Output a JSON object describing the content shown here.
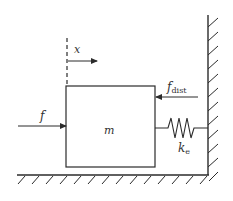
{
  "diagram": {
    "type": "mass-spring-wall",
    "stroke_color": "#2b2b2b",
    "labels": {
      "displacement": "x",
      "force": "f",
      "mass": "m",
      "disturbance_main": "f",
      "disturbance_sub": "dist",
      "stiffness_main": "k",
      "stiffness_sub": "e"
    },
    "elements": [
      {
        "id": "reference-line",
        "kind": "dashed-line"
      },
      {
        "id": "displacement-arrow",
        "direction": "right"
      },
      {
        "id": "mass-block"
      },
      {
        "id": "applied-force-arrow",
        "direction": "right"
      },
      {
        "id": "disturbance-force-arrow",
        "direction": "left"
      },
      {
        "id": "spring"
      },
      {
        "id": "wall",
        "hatched": true
      },
      {
        "id": "ground",
        "hatched": true
      }
    ]
  }
}
